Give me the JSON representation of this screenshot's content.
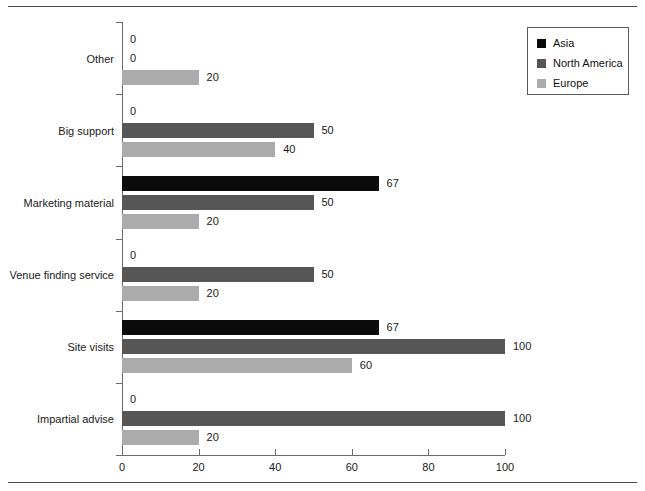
{
  "page": {
    "clipped_header_text": "",
    "background": "#ffffff"
  },
  "legend": {
    "position": "top-right",
    "items": [
      {
        "label": "Asia",
        "color": "#0b0b0b",
        "swatch": "asia"
      },
      {
        "label": "North America",
        "color": "#565656",
        "swatch": "na"
      },
      {
        "label": "Europe",
        "color": "#ababab",
        "swatch": "europe"
      }
    ]
  },
  "axis": {
    "x_ticks": [
      "0",
      "20",
      "40",
      "60",
      "80",
      "100"
    ],
    "x_min": 0,
    "x_max": 100
  },
  "chart_data": {
    "type": "bar",
    "orientation": "horizontal",
    "title": "",
    "xlabel": "",
    "ylabel": "",
    "xlim": [
      0,
      100
    ],
    "grid": false,
    "legend_position": "top-right",
    "value_labels": true,
    "categories": [
      "Other",
      "Big support",
      "Marketing material",
      "Venue finding service",
      "Site visits",
      "Impartial advise"
    ],
    "series": [
      {
        "name": "Asia",
        "color": "#0b0b0b",
        "values": [
          0,
          0,
          67,
          0,
          67,
          0
        ]
      },
      {
        "name": "North America",
        "color": "#565656",
        "values": [
          0,
          50,
          50,
          50,
          100,
          100
        ]
      },
      {
        "name": "Europe",
        "color": "#ababab",
        "values": [
          20,
          40,
          20,
          20,
          60,
          20
        ]
      }
    ]
  }
}
